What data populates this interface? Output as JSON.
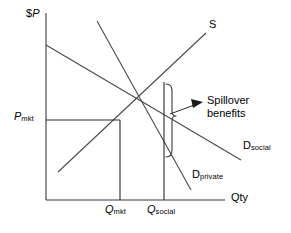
{
  "figure": {
    "type": "economics-supply-demand-diagram",
    "topic": "Spillover benefits / positive externality",
    "width": 291,
    "height": 233,
    "background_color": "#ffffff",
    "line_color": "#3a3a3a",
    "text_color": "#000000"
  },
  "axes": {
    "y_axis_label_currency": "$",
    "y_axis_label_variable": "P",
    "x_axis_label": "Qty",
    "y_axis": {
      "x": 46,
      "y_top": 13,
      "y_bottom": 200
    },
    "x_axis": {
      "y": 200,
      "x_left": 46,
      "x_right": 225
    }
  },
  "curves": [
    {
      "id": "supply",
      "label": "S",
      "label_sub": "",
      "label_x": 210,
      "label_y": 21,
      "x1": 58,
      "y1": 172,
      "x2": 206,
      "y2": 33
    },
    {
      "id": "demand-social",
      "label": "D",
      "label_sub": "social",
      "label_x": 244,
      "label_y": 141,
      "x1": 46,
      "y1": 45,
      "x2": 241,
      "y2": 160
    },
    {
      "id": "demand-private",
      "label": "D",
      "label_sub": "private",
      "label_x": 192,
      "label_y": 170,
      "x1": 97,
      "y1": 21,
      "x2": 191,
      "y2": 190
    }
  ],
  "equilibria": [
    {
      "id": "market",
      "price_label": "P",
      "price_sub": "mkt",
      "price_label_x": 14,
      "price_label_y": 111,
      "qty_label": "Q",
      "qty_sub": "mkt",
      "qty_label_x": 106,
      "qty_label_y": 205,
      "point_x": 120,
      "point_y": 120
    },
    {
      "id": "social",
      "price_label": "",
      "price_sub": "",
      "qty_label": "Q",
      "qty_sub": "social",
      "qty_label_x": 147,
      "qty_label_y": 205,
      "point_x": 164,
      "point_y": 82
    }
  ],
  "annotation": {
    "line1": "Spillover",
    "line2": "benefits",
    "text_x": 207,
    "text_y": 94,
    "arrow_tail_x": 170,
    "arrow_tail_y": 114,
    "arrow_head_x": 202,
    "arrow_head_y": 103,
    "brace_x": 172,
    "brace_top_y": 84,
    "brace_bottom_y": 157,
    "brace_tip_y": 116
  },
  "guides": {
    "price_line": {
      "x1": 46,
      "y1": 120,
      "x2": 120,
      "y2": 120
    },
    "qty_mkt_line": {
      "x": 120,
      "y_top": 120,
      "y_bottom": 200
    },
    "qty_social_line": {
      "x": 164,
      "y_top": 82,
      "y_bottom": 200
    }
  }
}
